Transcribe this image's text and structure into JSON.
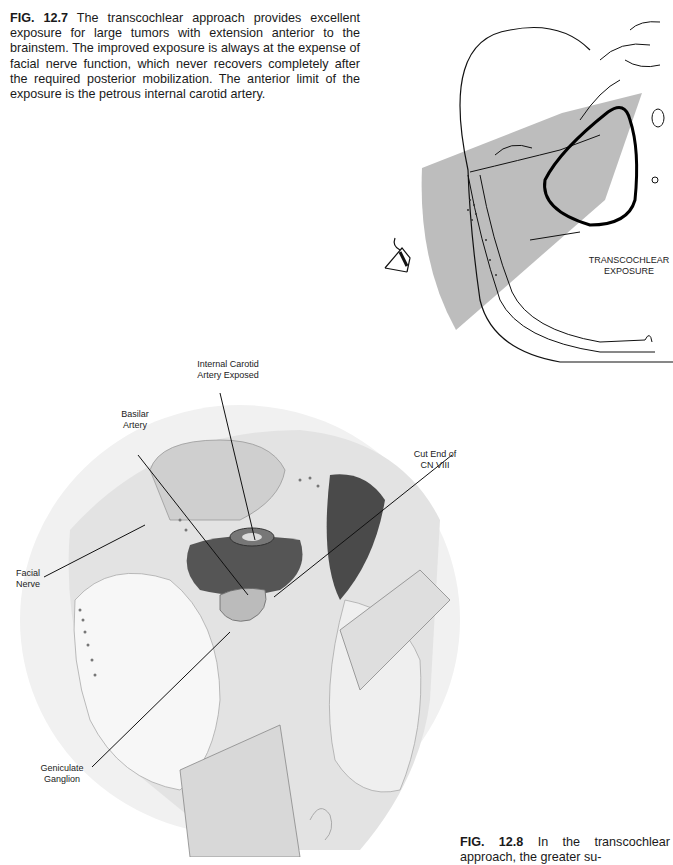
{
  "figure_12_7": {
    "caption_label": "FIG. 12.7",
    "caption_text": " The transcochlear approach provides excellent exposure for large tumors with extension anterior to the brainstem. The improved exposure is always at the expense of facial nerve function, which never recovers completely after the required posterior mobilization. The anterior limit of the exposure is the petrous internal carotid artery.",
    "diagram_label_line1": "TRANSCOCHLEAR",
    "diagram_label_line2": "EXPOSURE",
    "exposure_color": "#bdbdbd"
  },
  "figure_12_8": {
    "labels": {
      "ica_line1": "Internal Carotid",
      "ica_line2": "Artery Exposed",
      "basilar_line1": "Basilar",
      "basilar_line2": "Artery",
      "cn8_line1": "Cut End of",
      "cn8_line2": "CN VIII",
      "facial_line1": "Facial",
      "facial_line2": "Nerve",
      "geniculate_line1": "Geniculate",
      "geniculate_line2": "Ganglion"
    },
    "caption_label": "FIG. 12.8",
    "caption_text": " In the transcochlear approach, the greater su-"
  }
}
